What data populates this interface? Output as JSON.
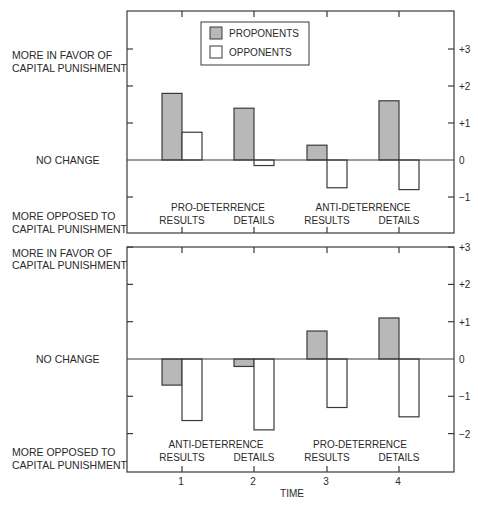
{
  "colors": {
    "proponent_fill": "#b8b8b8",
    "opponent_fill": "#ffffff",
    "stroke": "#3a3a3a"
  },
  "legend": {
    "items": [
      {
        "label": "PROPONENTS",
        "fill": "#b8b8b8"
      },
      {
        "label": "OPPONENTS",
        "fill": "#ffffff"
      }
    ]
  },
  "x_axis": {
    "title": "TIME",
    "ticks": [
      "1",
      "2",
      "3",
      "4"
    ]
  },
  "left_labels": {
    "favor_line1": "MORE IN FAVOR OF",
    "favor_line2": "CAPITAL PUNISHMENT",
    "no_change": "NO CHANGE",
    "opposed_line1": "MORE OPPOSED TO",
    "opposed_line2": "CAPITAL PUNISHMENT"
  },
  "panels": [
    {
      "name": "top-panel",
      "group_labels": [
        {
          "text": "PRO-DETERRENCE",
          "span": [
            1,
            2
          ]
        },
        {
          "text": "ANTI-DETERRENCE",
          "span": [
            3,
            4
          ]
        }
      ],
      "category_labels": [
        "RESULTS",
        "DETAILS",
        "RESULTS",
        "DETAILS"
      ],
      "y_ticks": [
        "+3",
        "+2",
        "+1",
        "0",
        "−1"
      ],
      "y_tick_values": [
        3,
        2,
        1,
        0,
        -1
      ]
    },
    {
      "name": "bottom-panel",
      "group_labels": [
        {
          "text": "ANTI-DETERRENCE",
          "span": [
            1,
            2
          ]
        },
        {
          "text": "PRO-DETERRENCE",
          "span": [
            3,
            4
          ]
        }
      ],
      "category_labels": [
        "RESULTS",
        "DETAILS",
        "RESULTS",
        "DETAILS"
      ],
      "y_ticks": [
        "+3",
        "+2",
        "+1",
        "0",
        "−1",
        "−2"
      ],
      "y_tick_values": [
        3,
        2,
        1,
        0,
        -1,
        -2
      ]
    }
  ],
  "chart_data": [
    {
      "type": "bar",
      "title": "Pro-deterrence then anti-deterrence information",
      "categories": [
        "1",
        "2",
        "3",
        "4"
      ],
      "category_labels": [
        "PRO-DETERRENCE RESULTS",
        "PRO-DETERRENCE DETAILS",
        "ANTI-DETERRENCE RESULTS",
        "ANTI-DETERRENCE DETAILS"
      ],
      "series": [
        {
          "name": "PROPONENTS",
          "values": [
            1.8,
            1.4,
            0.4,
            1.6
          ]
        },
        {
          "name": "OPPONENTS",
          "values": [
            0.75,
            -0.15,
            -0.75,
            -0.8
          ]
        }
      ],
      "xlabel": "TIME",
      "ylabel_top": "MORE IN FAVOR OF CAPITAL PUNISHMENT",
      "ylabel_middle": "NO CHANGE",
      "ylabel_bottom": "MORE OPPOSED TO CAPITAL PUNISHMENT",
      "ylim": [
        -2,
        4
      ],
      "y_ticks": [
        3,
        2,
        1,
        0,
        -1
      ],
      "grid": false,
      "legend_position": "top-center"
    },
    {
      "type": "bar",
      "title": "Anti-deterrence then pro-deterrence information",
      "categories": [
        "1",
        "2",
        "3",
        "4"
      ],
      "category_labels": [
        "ANTI-DETERRENCE RESULTS",
        "ANTI-DETERRENCE DETAILS",
        "PRO-DETERRENCE RESULTS",
        "PRO-DETERRENCE DETAILS"
      ],
      "series": [
        {
          "name": "PROPONENTS",
          "values": [
            -0.7,
            -0.2,
            0.75,
            1.1
          ]
        },
        {
          "name": "OPPONENTS",
          "values": [
            -1.65,
            -1.9,
            -1.3,
            -1.55
          ]
        }
      ],
      "xlabel": "TIME",
      "ylabel_top": "MORE IN FAVOR OF CAPITAL PUNISHMENT",
      "ylabel_middle": "NO CHANGE",
      "ylabel_bottom": "MORE OPPOSED TO CAPITAL PUNISHMENT",
      "ylim": [
        -3,
        3
      ],
      "y_ticks": [
        3,
        2,
        1,
        0,
        -1,
        -2
      ],
      "grid": false
    }
  ]
}
